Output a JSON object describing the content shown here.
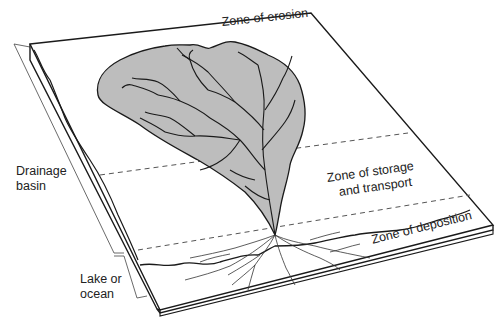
{
  "diagram": {
    "type": "block-diagram",
    "labels": {
      "zone_erosion": "Zone of erosion",
      "zone_storage_line1": "Zone of storage",
      "zone_storage_line2": "and transport",
      "zone_deposition": "Zone of deposition",
      "drainage_basin_line1": "Drainage",
      "drainage_basin_line2": "basin",
      "lake_line1": "Lake or",
      "lake_line2": "ocean"
    },
    "colors": {
      "basin_fill": "#bdbdbd",
      "line": "#1a1a1a",
      "dashed": "#555555",
      "background": "#ffffff"
    }
  }
}
